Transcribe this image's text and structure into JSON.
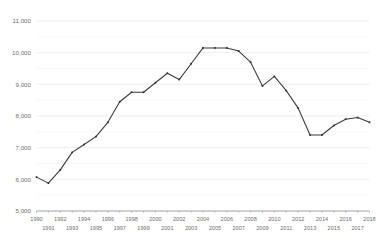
{
  "chart_data": {
    "type": "line",
    "title": "",
    "subtitle": "",
    "xlabel": "",
    "ylabel": "",
    "grid": true,
    "legend": false,
    "legend_position": "none",
    "line_color": "#3a3a3a",
    "marker_color": "#2e2e2e",
    "gridline_color": "#e8e8e8",
    "axis_color": "#8a8a8a",
    "label_color": "#6f6f6f",
    "background_color": "#ffffff",
    "xlim": [
      1990,
      2018
    ],
    "ylim": [
      5000,
      11000
    ],
    "ytick_step": 1000,
    "yticks": [
      5000,
      6000,
      7000,
      8000,
      9000,
      10000,
      11000
    ],
    "ytick_labels": [
      "5,000",
      "6,000",
      "7,000",
      "8,000",
      "9,000",
      "10,000",
      "11,000"
    ],
    "yminor_ticks": [
      5500,
      6500,
      7500,
      8500,
      9500,
      10500
    ],
    "xticks": [
      1990,
      1991,
      1992,
      1993,
      1994,
      1995,
      1996,
      1997,
      1998,
      1999,
      2000,
      2001,
      2002,
      2003,
      2004,
      2005,
      2006,
      2007,
      2008,
      2009,
      2010,
      2011,
      2012,
      2013,
      2014,
      2015,
      2016,
      2017,
      2018
    ],
    "xtick_labels_top": [
      "1990",
      "1992",
      "1994",
      "1996",
      "1998",
      "2000",
      "2002",
      "2004",
      "2006",
      "2008",
      "2010",
      "2012",
      "2014",
      "2016",
      "2018"
    ],
    "xtick_labels_bottom": [
      "1991",
      "1993",
      "1995",
      "1997",
      "1999",
      "2001",
      "2003",
      "2005",
      "2007",
      "2009",
      "2011",
      "2013",
      "2015",
      "2017"
    ],
    "categories": [
      1990,
      1991,
      1992,
      1993,
      1994,
      1995,
      1996,
      1997,
      1998,
      1999,
      2000,
      2001,
      2002,
      2003,
      2004,
      2005,
      2006,
      2007,
      2008,
      2009,
      2010,
      2011,
      2012,
      2013,
      2014,
      2015,
      2016,
      2017,
      2018
    ],
    "values": [
      6070,
      5880,
      6300,
      6850,
      7100,
      7350,
      7800,
      8450,
      8750,
      8750,
      9050,
      9350,
      9150,
      9650,
      10150,
      10150,
      10150,
      10050,
      9700,
      8950,
      9250,
      8800,
      8250,
      7400,
      7400,
      7700,
      7900,
      7950,
      7800
    ],
    "markers": true,
    "marker_shape": "square"
  }
}
